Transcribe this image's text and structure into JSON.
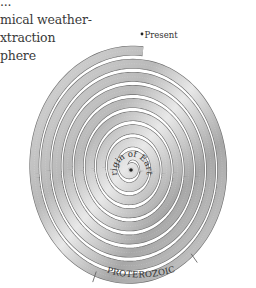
{
  "text_block": {
    "lines": [
      "...",
      "mical weather-",
      "xtraction",
      "phere"
    ]
  },
  "diagram": {
    "type": "spiral-timeline",
    "center_label": "Origin of Earth",
    "end_label": "Present",
    "era_label": "PROTEROZOIC",
    "center": [
      131,
      168
    ],
    "turns": 9,
    "outer_radius": 104,
    "colors": {
      "band_light": "#e4e4e4",
      "band_mid": "#c4c4c4",
      "band_dark": "#9a9a9a",
      "gap": "#ffffff",
      "stroke": "#6d6d6d"
    }
  }
}
